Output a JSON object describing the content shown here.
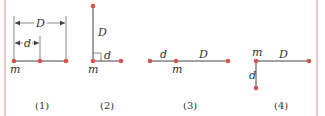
{
  "colors": {
    "border": "#e0a0a0",
    "dot": "#d9534f",
    "line": "#444444",
    "text": "#333333"
  },
  "figures": [
    {
      "caption": "(1)",
      "labels": {
        "mass": "m",
        "small": "d",
        "large": "D"
      },
      "description": "Three collinear masses; d is distance from m to middle mass, D is distance from m to far mass"
    },
    {
      "caption": "(2)",
      "labels": {
        "mass": "m",
        "small": "d",
        "large": "D"
      },
      "description": "Mass m with one mass at distance D vertically above and one at distance d horizontally to the right, right angle marked"
    },
    {
      "caption": "(3)",
      "labels": {
        "mass": "m",
        "small": "d",
        "large": "D"
      },
      "description": "Three collinear masses; m in the middle, d to the left, D to the right"
    },
    {
      "caption": "(4)",
      "labels": {
        "mass": "m",
        "small": "d",
        "large": "D"
      },
      "description": "Mass m with one mass at distance D horizontally to the right and one at distance d vertically below"
    }
  ]
}
